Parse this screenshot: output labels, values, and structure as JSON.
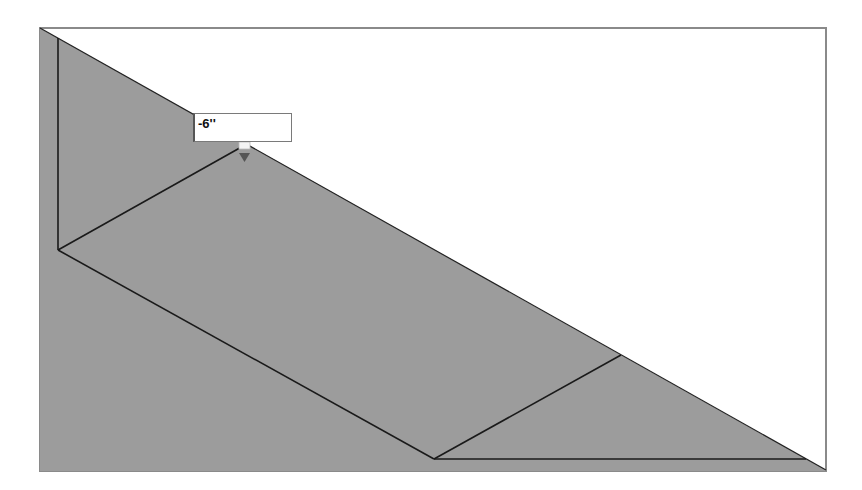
{
  "canvas": {
    "frame": {
      "x1": 40,
      "y1": 28,
      "x2": 826,
      "y2": 471
    },
    "colors": {
      "fill": "#9c9c9c",
      "frame": "#8a8a8a",
      "edge": "#1a1a1a",
      "marker": "#555555",
      "background": "#ffffff"
    }
  },
  "dimension_input": {
    "value": "-6''"
  },
  "shape": {
    "diagonal": [
      [
        40,
        28
      ],
      [
        826,
        470
      ]
    ],
    "edges": [
      [
        [
          58,
          38
        ],
        [
          58,
          250
        ]
      ],
      [
        [
          58,
          250
        ],
        [
          245,
          145
        ]
      ],
      [
        [
          58,
          250
        ],
        [
          434,
          459
        ]
      ],
      [
        [
          434,
          459
        ],
        [
          621,
          355
        ]
      ],
      [
        [
          434,
          459
        ],
        [
          806,
          459
        ]
      ]
    ]
  }
}
